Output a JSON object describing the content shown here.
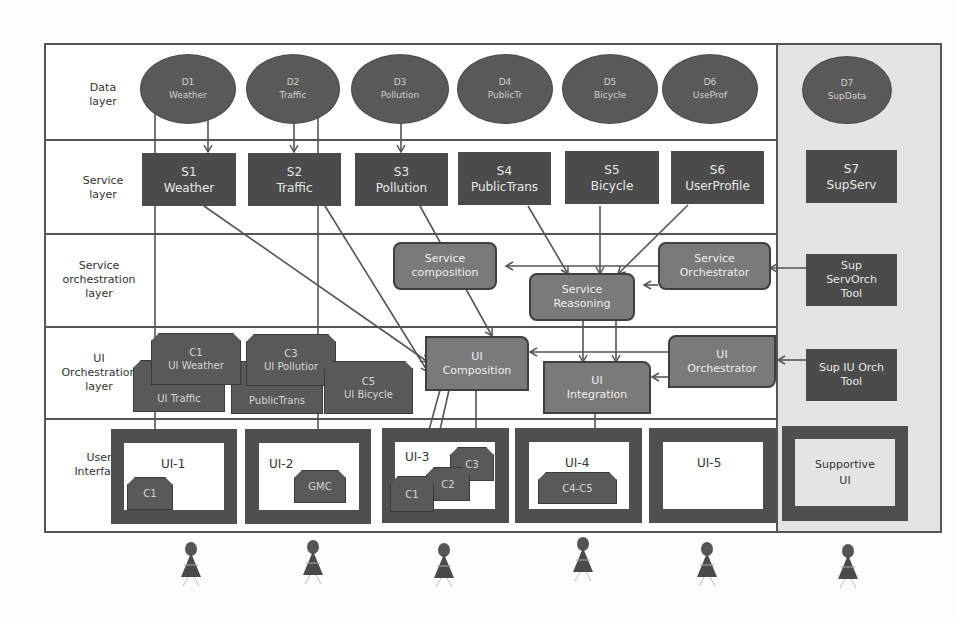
{
  "layers": [
    {
      "id": "data",
      "label": "Data layer"
    },
    {
      "id": "service",
      "label": "Service layer"
    },
    {
      "id": "service-orch",
      "label": "Service orchestration layer"
    },
    {
      "id": "ui-orch",
      "label": "UI Orchestration layer"
    },
    {
      "id": "user-interface",
      "label": "User Interface"
    }
  ],
  "data_sources": [
    {
      "id": "D1",
      "name": "Weather"
    },
    {
      "id": "D2",
      "name": "Traffic"
    },
    {
      "id": "D3",
      "name": "Pollution"
    },
    {
      "id": "D4",
      "name": "PublicTr"
    },
    {
      "id": "D5",
      "name": "Bicycle"
    },
    {
      "id": "D6",
      "name": "UseProf"
    },
    {
      "id": "D7",
      "name": "SupData"
    }
  ],
  "services": [
    {
      "id": "S1",
      "name": "Weather"
    },
    {
      "id": "S2",
      "name": "Traffic"
    },
    {
      "id": "S3",
      "name": "Pollution"
    },
    {
      "id": "S4",
      "name": "PublicTrans"
    },
    {
      "id": "S5",
      "name": "Bicycle"
    },
    {
      "id": "S6",
      "name": "UserProfile"
    },
    {
      "id": "S7",
      "name": "SupServ"
    }
  ],
  "service_orchestration": {
    "composition": {
      "line1": "Service",
      "line2": "composition"
    },
    "reasoning": {
      "line1": "Service",
      "line2": "Reasoning"
    },
    "orchestrator": {
      "line1": "Service",
      "line2": "Orchestrator"
    },
    "sup_tool": {
      "line1": "Sup",
      "line2": "ServOrch",
      "line3": "Tool"
    }
  },
  "ui_orchestration": {
    "components": [
      {
        "id": "C1",
        "name": "UI Weather"
      },
      {
        "id": "",
        "name": "UI Traffic"
      },
      {
        "id": "C3",
        "name": "UI Pollutior"
      },
      {
        "id": "",
        "name": "PublicTrans"
      },
      {
        "id": "C5",
        "name": "UI Bicycle"
      }
    ],
    "composition": {
      "line1": "UI",
      "line2": "Composition"
    },
    "integration": {
      "line1": "UI",
      "line2": "Integration"
    },
    "orchestrator": {
      "line1": "UI",
      "line2": "Orchestrator"
    },
    "sup_tool": {
      "line1": "Sup IU Orch",
      "line2": "Tool"
    }
  },
  "user_interfaces": [
    {
      "title": "UI-1",
      "components": [
        "C1"
      ]
    },
    {
      "title": "UI-2",
      "components": [
        "GMC"
      ]
    },
    {
      "title": "UI-3",
      "components": [
        "C1",
        "C2",
        "C3"
      ]
    },
    {
      "title": "UI-4",
      "components": [
        "C4-C5"
      ]
    },
    {
      "title": "UI-5",
      "components": []
    },
    {
      "title": "Supportive UI",
      "line1": "Supportive",
      "line2": "UI",
      "components": []
    }
  ],
  "users": 6,
  "colors": {
    "frame": "#555555",
    "dark_box": "#4b4b4b",
    "ellipse": "#595959",
    "orch_box": "#7a7a7a",
    "support_column": "#e4e4e4",
    "background": "#ffffff"
  }
}
